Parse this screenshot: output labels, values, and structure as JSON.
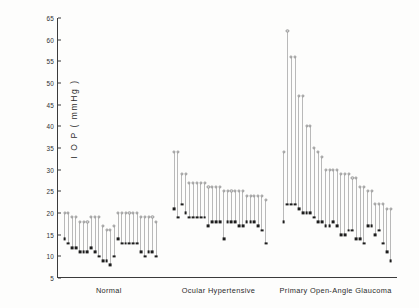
{
  "chart_data": {
    "type": "scatter",
    "title": "",
    "xlabel": "",
    "ylabel": "I O P ( mmHg )",
    "ylim": [
      5,
      65
    ],
    "yticks": [
      65,
      60,
      55,
      50,
      45,
      40,
      35,
      30,
      25,
      20,
      15,
      10,
      5
    ],
    "grid": false,
    "legend": null,
    "marker_hi": "open-circle",
    "marker_lo": "filled-square",
    "note": "Each vertical bar is one patient: open circle = maximum IOP, filled square = minimum IOP.",
    "categories": [
      "Normal",
      "Ocular Hypertensive",
      "Primary Open-Angle Glaucoma"
    ],
    "groups": [
      {
        "name": "Normal",
        "series": [
          {
            "name": "max",
            "values": [
              20,
              20,
              19,
              19,
              18,
              18,
              18,
              19,
              19,
              19,
              17,
              16,
              16,
              17,
              20,
              20,
              20,
              20,
              20,
              20,
              19,
              19,
              19,
              19,
              18
            ]
          },
          {
            "name": "min",
            "values": [
              14,
              13,
              12,
              12,
              11,
              11,
              11,
              12,
              11,
              10,
              9,
              9,
              8,
              10,
              14,
              13,
              13,
              13,
              13,
              13,
              11,
              10,
              11,
              11,
              10
            ]
          }
        ]
      },
      {
        "name": "Ocular Hypertensive",
        "series": [
          {
            "name": "max",
            "values": [
              34,
              34,
              29,
              29,
              27,
              27,
              27,
              27,
              27,
              26,
              26,
              26,
              26,
              25,
              25,
              25,
              25,
              25,
              25,
              24,
              24,
              24,
              24,
              24,
              23
            ]
          },
          {
            "name": "min",
            "values": [
              21,
              19,
              22,
              20,
              19,
              19,
              19,
              19,
              19,
              17,
              18,
              18,
              18,
              14,
              18,
              18,
              18,
              17,
              17,
              18,
              18,
              18,
              17,
              16,
              13
            ]
          }
        ]
      },
      {
        "name": "Primary Open-Angle Glaucoma",
        "series": [
          {
            "name": "max",
            "values": [
              34,
              62,
              56,
              56,
              47,
              47,
              40,
              40,
              35,
              34,
              33,
              30,
              30,
              30,
              30,
              29,
              29,
              29,
              28,
              28,
              26,
              26,
              25,
              25,
              22,
              22,
              22,
              21,
              21
            ]
          },
          {
            "name": "min",
            "values": [
              18,
              22,
              22,
              22,
              21,
              20,
              20,
              20,
              19,
              18,
              18,
              17,
              17,
              18,
              17,
              15,
              15,
              16,
              16,
              14,
              14,
              13,
              17,
              17,
              15,
              16,
              13,
              11,
              9
            ]
          }
        ]
      }
    ]
  },
  "axis": {
    "y_title": "I O P ( mmHg )"
  }
}
